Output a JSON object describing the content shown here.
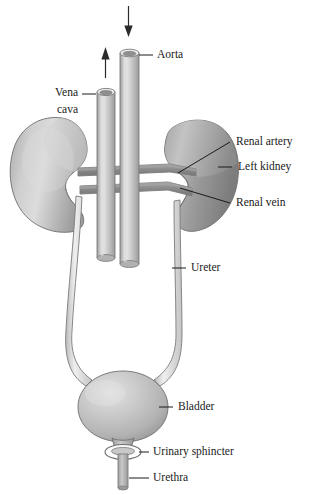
{
  "diagram": {
    "background_color": "#ffffff",
    "ink_color": "#1a1a1a",
    "palette": {
      "kidney_light": "#bdbdbd",
      "kidney_dark": "#8c8c8c",
      "vessel_tube": "#c2c2c2",
      "vessel_band": "#8f8f8f",
      "bladder": "#bcbcbc",
      "ureter": "#e2e2e2",
      "outline": "#6e6e6e"
    }
  },
  "labels": {
    "aorta": "Aorta",
    "vena_cava_line1": "Vena",
    "vena_cava_line2": "cava",
    "renal_artery": "Renal artery",
    "left_kidney": "Left kidney",
    "renal_vein": "Renal vein",
    "ureter": "Ureter",
    "bladder": "Bladder",
    "urinary_sphincter": "Urinary sphincter",
    "urethra": "Urethra"
  },
  "flow_arrows": [
    {
      "name": "aorta-inflow-arrow",
      "direction": "down"
    },
    {
      "name": "vena-cava-outflow-arrow",
      "direction": "up"
    }
  ],
  "structures": [
    "right-kidney",
    "left-kidney",
    "aorta",
    "vena-cava",
    "renal-artery",
    "renal-vein",
    "right-ureter",
    "left-ureter",
    "bladder",
    "urinary-sphincter",
    "urethra"
  ]
}
